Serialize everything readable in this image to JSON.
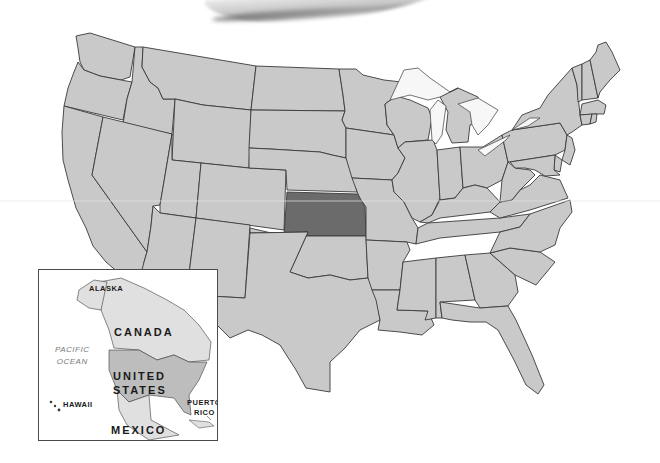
{
  "map": {
    "title": "United States",
    "highlighted_state": "Kansas",
    "colors": {
      "land": "#c9c9c9",
      "highlight": "#6b6b6b",
      "border": "#3a3a3a",
      "water": "#ffffff",
      "inset_us": "#bdbdbd",
      "inset_other": "#e0e0e0"
    }
  },
  "inset": {
    "labels": {
      "alaska": "ALASKA",
      "canada": "CANADA",
      "pacific_line1": "PACIFIC",
      "pacific_line2": "OCEAN",
      "united": "UNITED",
      "states": "STATES",
      "hawaii": "HAWAII",
      "puerto1": "PUERTO",
      "puerto2": "RICO",
      "mexico": "MEXICO"
    }
  }
}
